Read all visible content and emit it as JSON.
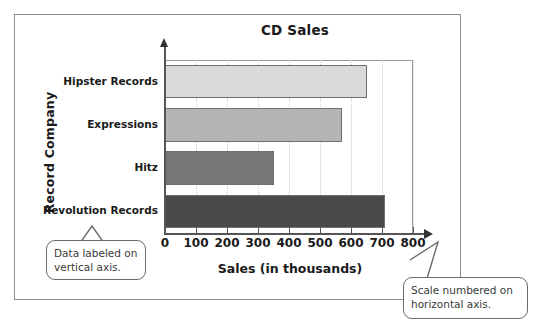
{
  "chart_data": {
    "type": "bar",
    "orientation": "horizontal",
    "title": "CD Sales",
    "xlabel": "Sales (in thousands)",
    "ylabel": "Record Company",
    "categories": [
      "Hipster Records",
      "Expressions",
      "Hitz",
      "Revolution Records"
    ],
    "values": [
      650,
      570,
      350,
      710
    ],
    "xlim": [
      0,
      800
    ],
    "xticks": [
      0,
      100,
      200,
      300,
      400,
      500,
      600,
      700,
      800
    ],
    "xtick_labels": [
      "0",
      "100",
      "200",
      "300",
      "400",
      "500",
      "600",
      "700",
      "800"
    ],
    "grid": "vertical-dotted",
    "legend": "none",
    "bar_colors": [
      "#d9d9d9",
      "#b5b5b5",
      "#767676",
      "#4a4a4a"
    ],
    "bar_border_color": "#6f6f6f"
  },
  "annotations": [
    {
      "name": "vertical-axis-note",
      "text": "Data labeled on vertical axis."
    },
    {
      "name": "horizontal-axis-note",
      "text": "Scale numbered on horizontal axis."
    }
  ],
  "colors": {
    "frame": "#8e8e8e",
    "axis": "#555555",
    "grid": "#c9c9c9",
    "text": "#1a1a1a",
    "callout_border": "#6b6b6b"
  }
}
